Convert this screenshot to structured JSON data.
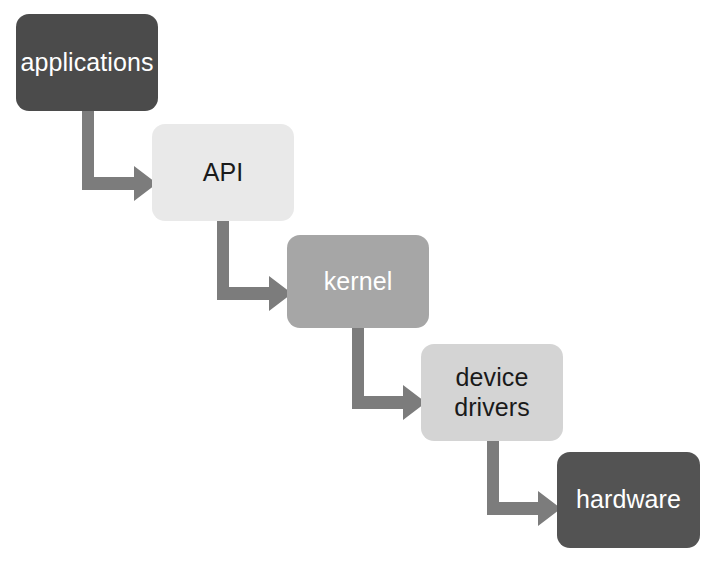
{
  "diagram": {
    "background_color": "#ffffff",
    "arrow_color": "#7c7c7c",
    "nodes": [
      {
        "id": "applications",
        "label": "applications",
        "fill": "#4b4b4b",
        "text_color": "#ffffff",
        "order": 1
      },
      {
        "id": "api",
        "label": "API",
        "fill": "#e9e9e9",
        "text_color": "#1a1a1a",
        "order": 2
      },
      {
        "id": "kernel",
        "label": "kernel",
        "fill": "#a6a6a6",
        "text_color": "#ffffff",
        "order": 3
      },
      {
        "id": "device-drivers",
        "label": "device\ndrivers",
        "fill": "#d4d4d4",
        "text_color": "#1a1a1a",
        "order": 4
      },
      {
        "id": "hardware",
        "label": "hardware",
        "fill": "#535353",
        "text_color": "#ffffff",
        "order": 5
      }
    ],
    "edges": [
      {
        "id": "applications-to-api",
        "from": "applications",
        "to": "api"
      },
      {
        "id": "api-to-kernel",
        "from": "api",
        "to": "kernel"
      },
      {
        "id": "kernel-to-device-drivers",
        "from": "kernel",
        "to": "device-drivers"
      },
      {
        "id": "device-drivers-to-hardware",
        "from": "device-drivers",
        "to": "hardware"
      }
    ]
  }
}
